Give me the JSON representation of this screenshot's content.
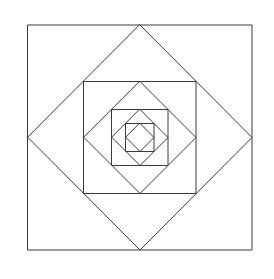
{
  "figure": {
    "background_color": "#ffffff",
    "stroke_color": "#3a3a3a",
    "stroke_width": 1,
    "center": {
      "x": 140,
      "y": 137.5
    },
    "levels": 8,
    "canvas": {
      "width": 274,
      "height": 279
    }
  },
  "chart_data": {
    "type": "diagram",
    "shapes": [
      {
        "name": "outer-square",
        "kind": "square",
        "rotation_deg": 0,
        "half_size": 112,
        "points": "28,25 252,25 252,250 28,250"
      },
      {
        "name": "diamond-1",
        "kind": "diamond",
        "rotation_deg": 45,
        "half_size": 112,
        "points": "140,25 252,137.5 140,250 28,137.5"
      },
      {
        "name": "square-2",
        "kind": "square",
        "rotation_deg": 0,
        "half_size": 56,
        "points": "84,81.5 196,81.5 196,193.5 84,193.5"
      },
      {
        "name": "diamond-2",
        "kind": "diamond",
        "rotation_deg": 45,
        "half_size": 56,
        "points": "140,81.5 196,137.5 140,193.5 84,137.5"
      },
      {
        "name": "square-3",
        "kind": "square",
        "rotation_deg": 0,
        "half_size": 28,
        "points": "112,109.5 168,109.5 168,165.5 112,165.5"
      },
      {
        "name": "diamond-3",
        "kind": "diamond",
        "rotation_deg": 45,
        "half_size": 28,
        "points": "140,109.5 168,137.5 140,165.5 112,137.5"
      },
      {
        "name": "square-4",
        "kind": "square",
        "rotation_deg": 0,
        "half_size": 14,
        "points": "126,123.5 154,123.5 154,151.5 126,151.5"
      },
      {
        "name": "diamond-4",
        "kind": "diamond",
        "rotation_deg": 45,
        "half_size": 14,
        "points": "140,123.5 154,137.5 140,151.5 126,137.5"
      }
    ]
  }
}
